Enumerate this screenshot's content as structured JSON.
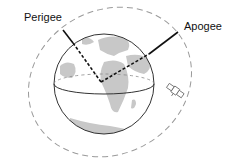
{
  "diagram": {
    "type": "orbit-diagram",
    "labels": {
      "perigee": "Perigee",
      "apogee": "Apogee"
    },
    "elements": [
      "earth-globe",
      "elliptical-orbit",
      "perigee-line",
      "apogee-line",
      "equator",
      "satellite"
    ],
    "colors": {
      "orbit": "#9a9a9a",
      "globe_outline": "#333333",
      "land": "#c8c8c8",
      "lines": "#111111"
    }
  }
}
